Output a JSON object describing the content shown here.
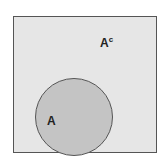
{
  "diagram": {
    "type": "venn",
    "universe": {
      "label": "A^c",
      "label_main": "A",
      "label_sup": "c",
      "fill": "#e6e6e6",
      "stroke": "#555555"
    },
    "sets": [
      {
        "label": "A",
        "fill": "#c4c4c4",
        "stroke": "#555555"
      }
    ]
  }
}
